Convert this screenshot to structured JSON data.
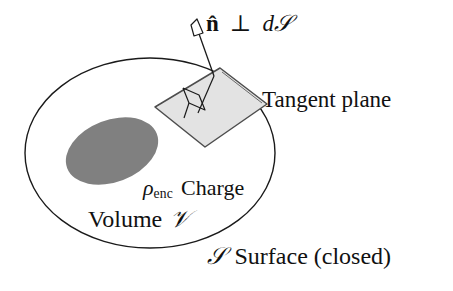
{
  "figure": {
    "background_color": "#ffffff",
    "stroke_color": "#1a1a1a",
    "labels": {
      "normal_vector": {
        "name": "n-hat-perp-dS",
        "vector_symbol": "n",
        "hat": "̂",
        "perp_symbol": "⊥",
        "differential": "d",
        "surface_symbol": "𝒮",
        "full_text": "n̂ ⊥ d𝒮"
      },
      "tangent_plane": {
        "name": "tangent-plane-label",
        "text": "Tangent plane"
      },
      "charge": {
        "name": "charge-density-label",
        "rho_symbol": "ρ",
        "subscript": "enc",
        "text": "Charge",
        "full_text": "ρenc Charge"
      },
      "volume": {
        "name": "volume-label",
        "text": "Volume",
        "symbol": "𝒱",
        "full_text": "Volume 𝒱"
      },
      "surface": {
        "name": "surface-label",
        "symbol": "𝒮",
        "text": "Surface (closed)",
        "full_text": "𝒮 Surface (closed)"
      }
    },
    "shapes": {
      "closed_surface_ellipse": {
        "name": "closed-surface-ellipse",
        "center_x": 150,
        "center_y": 153,
        "radius_x": 125,
        "radius_y": 95,
        "fill": "none",
        "stroke": "#1a1a1a",
        "stroke_width": 1.4
      },
      "charge_blob": {
        "name": "enclosed-charge-blob",
        "center_x": 112,
        "center_y": 151,
        "radius_x": 48,
        "radius_y": 31,
        "rotation_deg": -21,
        "fill": "#808080",
        "stroke": "none"
      },
      "tangent_patch": {
        "name": "tangent-plane-patch",
        "points": "155,107 220,68 267,104 205,147",
        "fill": "#e3e3e3",
        "stroke": "#4d4d4d",
        "stroke_width": 1.5
      },
      "normal_arrow": {
        "name": "normal-vector-arrow",
        "tail_x": 214,
        "tail_y": 76,
        "head_x": 196,
        "head_y": 27,
        "stroke": "#1a1a1a",
        "stroke_width": 1.3
      },
      "right_angle_marker": {
        "name": "right-angle-marker",
        "fill": "none",
        "stroke": "#1a1a1a",
        "stroke_width": 1.3
      }
    }
  }
}
